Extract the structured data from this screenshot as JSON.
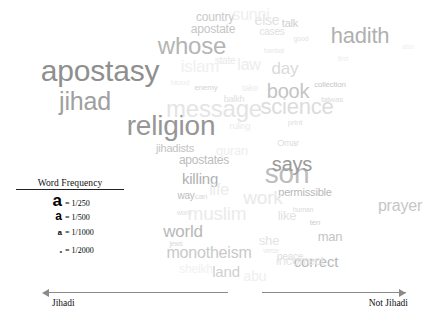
{
  "figure": {
    "type": "word-cloud",
    "background": "#ffffff"
  },
  "legend": {
    "title": "Word Frequency",
    "rows": [
      {
        "glyph": "a",
        "glyph_size_px": 17,
        "value": "= 1/250"
      },
      {
        "glyph": "a",
        "glyph_size_px": 12,
        "value": "= 1/500"
      },
      {
        "glyph": "a",
        "glyph_size_px": 7.5,
        "value": "= 1/1000"
      },
      {
        "glyph": "a",
        "glyph_size_px": 4,
        "value": "= 1/2000"
      }
    ]
  },
  "axis": {
    "left_label": "Jihadi",
    "right_label": "Not Jihadi",
    "line_color": "#8a8a8a"
  },
  "chart_data": {
    "type": "word-cloud",
    "title": "",
    "xlabel": "",
    "ylabel": "",
    "legend_position": "bottom-left",
    "axis_left": "Jihadi",
    "axis_right": "Not Jihadi",
    "frequency_scale": [
      "1/250",
      "1/500",
      "1/1000",
      "1/2000"
    ],
    "note": "Font size encodes word frequency; darkness/opacity encodes prominence. X position spans a Jihadi (left) to Not Jihadi (right) continuum.",
    "words": [
      {
        "text": "apostasy",
        "x": 100,
        "y": 71,
        "size": 30,
        "color": "#8f8f8f",
        "opacity": 1.0
      },
      {
        "text": "religion",
        "x": 171,
        "y": 126,
        "size": 28,
        "color": "#969696",
        "opacity": 1.0
      },
      {
        "text": "jihad",
        "x": 85,
        "y": 101,
        "size": 25,
        "color": "#a0a0a0",
        "opacity": 1.0
      },
      {
        "text": "whose",
        "x": 192,
        "y": 46,
        "size": 24,
        "color": "#b4b4b4",
        "opacity": 1.0
      },
      {
        "text": "hadith",
        "x": 360,
        "y": 36,
        "size": 22,
        "color": "#b0b0b0",
        "opacity": 1.0
      },
      {
        "text": "son",
        "x": 287,
        "y": 174,
        "size": 28,
        "color": "#bdbdbd",
        "opacity": 1.0
      },
      {
        "text": "says",
        "x": 292,
        "y": 164,
        "size": 20,
        "color": "#9a9a9a",
        "opacity": 1.0
      },
      {
        "text": "book",
        "x": 288,
        "y": 91,
        "size": 20,
        "color": "#c4c4c4",
        "opacity": 1.0
      },
      {
        "text": "science",
        "x": 297,
        "y": 107,
        "size": 22,
        "color": "#dcdcdc",
        "opacity": 1.0
      },
      {
        "text": "message",
        "x": 214,
        "y": 109,
        "size": 24,
        "color": "#e4e4e4",
        "opacity": 1.0
      },
      {
        "text": "monotheism",
        "x": 209,
        "y": 253,
        "size": 16,
        "color": "#c9c9c9",
        "opacity": 1.0
      },
      {
        "text": "world",
        "x": 183,
        "y": 231,
        "size": 17,
        "color": "#b8b8b8",
        "opacity": 1.0
      },
      {
        "text": "killing",
        "x": 200,
        "y": 178,
        "size": 15,
        "color": "#b0b0b0",
        "opacity": 1.0
      },
      {
        "text": "apostates",
        "x": 204,
        "y": 160,
        "size": 12,
        "color": "#bcbcbc",
        "opacity": 1.0
      },
      {
        "text": "jihadists",
        "x": 175,
        "y": 148,
        "size": 11,
        "color": "#c2c2c2",
        "opacity": 1.0
      },
      {
        "text": "prayer",
        "x": 400,
        "y": 206,
        "size": 16,
        "color": "#c6c6c6",
        "opacity": 1.0
      },
      {
        "text": "correct",
        "x": 316,
        "y": 261,
        "size": 15,
        "color": "#b9b9b9",
        "opacity": 1.0
      },
      {
        "text": "permissible",
        "x": 305,
        "y": 192,
        "size": 11,
        "color": "#b8b8b8",
        "opacity": 1.0
      },
      {
        "text": "land",
        "x": 226,
        "y": 271,
        "size": 15,
        "color": "#cfcfcf",
        "opacity": 1.0
      },
      {
        "text": "man",
        "x": 330,
        "y": 236,
        "size": 13,
        "color": "#c4c4c4",
        "opacity": 1.0
      },
      {
        "text": "day",
        "x": 285,
        "y": 68,
        "size": 17,
        "color": "#dadada",
        "opacity": 1.0
      },
      {
        "text": "apostate",
        "x": 213,
        "y": 29,
        "size": 12,
        "color": "#c6c6c6",
        "opacity": 1.0
      },
      {
        "text": "country",
        "x": 215,
        "y": 17,
        "size": 12,
        "color": "#c9c9c9",
        "opacity": 1.0
      },
      {
        "text": "talk",
        "x": 290,
        "y": 23,
        "size": 11,
        "color": "#cecece",
        "opacity": 1.0
      },
      {
        "text": "collection",
        "x": 330,
        "y": 85,
        "size": 8,
        "color": "#c8c8c8",
        "opacity": 1.0
      },
      {
        "text": "way",
        "x": 186,
        "y": 196,
        "size": 10,
        "color": "#bcbcbc",
        "opacity": 1.0
      },
      {
        "text": "enemy",
        "x": 206,
        "y": 88,
        "size": 8,
        "color": "#d4d4d4",
        "opacity": 1.0
      },
      {
        "text": "else",
        "x": 267,
        "y": 20,
        "size": 14,
        "color": "#e2e2e2",
        "opacity": 1.0
      },
      {
        "text": "cases",
        "x": 272,
        "y": 32,
        "size": 10,
        "color": "#e0e0e0",
        "opacity": 1.0
      },
      {
        "text": "fatwas",
        "x": 332,
        "y": 100,
        "size": 8,
        "color": "#dddddd",
        "opacity": 1.0
      },
      {
        "text": "Omar",
        "x": 288,
        "y": 143,
        "size": 9,
        "color": "#dcdcdc",
        "opacity": 1.0
      },
      {
        "text": "ten",
        "x": 315,
        "y": 223,
        "size": 8,
        "color": "#cfcfcf",
        "opacity": 1.0
      },
      {
        "text": "human",
        "x": 303,
        "y": 209,
        "size": 7,
        "color": "#dbdbdb",
        "opacity": 1.0
      },
      {
        "text": "like",
        "x": 287,
        "y": 215,
        "size": 13,
        "color": "#e3e3e3",
        "opacity": 1.0
      },
      {
        "text": "she",
        "x": 269,
        "y": 240,
        "size": 13,
        "color": "#e4e4e4",
        "opacity": 1.0
      },
      {
        "text": "peace",
        "x": 290,
        "y": 257,
        "size": 10,
        "color": "#e0e0e0",
        "opacity": 1.0
      },
      {
        "text": "jews",
        "x": 176,
        "y": 243,
        "size": 7,
        "color": "#d8d8d8",
        "opacity": 1.0
      },
      {
        "text": "can",
        "x": 201,
        "y": 197,
        "size": 8,
        "color": "#dadada",
        "opacity": 1.0
      },
      {
        "text": "word",
        "x": 184,
        "y": 212,
        "size": 7,
        "color": "#dedede",
        "opacity": 1.0
      },
      {
        "text": "muslim",
        "x": 217,
        "y": 213,
        "size": 19,
        "color": "#ebebeb",
        "opacity": 1.0
      },
      {
        "text": "incorrect",
        "x": 300,
        "y": 260,
        "size": 13,
        "color": "#e6e6e6",
        "opacity": 1.0
      },
      {
        "text": "work",
        "x": 263,
        "y": 197,
        "size": 19,
        "color": "#e9e9e9",
        "opacity": 1.0
      },
      {
        "text": "life",
        "x": 219,
        "y": 190,
        "size": 16,
        "color": "#ececec",
        "opacity": 1.0
      },
      {
        "text": "state",
        "x": 225,
        "y": 61,
        "size": 10,
        "color": "#e8e8e8",
        "opacity": 1.0
      },
      {
        "text": "balkh",
        "x": 234,
        "y": 99,
        "size": 9,
        "color": "#e0e0e0",
        "opacity": 1.0
      },
      {
        "text": "print",
        "x": 295,
        "y": 123,
        "size": 8,
        "color": "#e2e2e2",
        "opacity": 1.0
      },
      {
        "text": "good",
        "x": 301,
        "y": 38,
        "size": 7,
        "color": "#e4e4e4",
        "opacity": 1.0
      },
      {
        "text": "hanbal",
        "x": 274,
        "y": 50,
        "size": 7,
        "color": "#e9e9e9",
        "opacity": 1.0
      },
      {
        "text": "law",
        "x": 249,
        "y": 65,
        "size": 16,
        "color": "#ededed",
        "opacity": 1.0
      },
      {
        "text": "sunni",
        "x": 251,
        "y": 15,
        "size": 16,
        "color": "#efefef",
        "opacity": 1.0
      },
      {
        "text": "ruling",
        "x": 240,
        "y": 126,
        "size": 9,
        "color": "#ebebeb",
        "opacity": 1.0
      },
      {
        "text": "islam",
        "x": 200,
        "y": 66,
        "size": 17,
        "color": "#f0f0f0",
        "opacity": 1.0
      },
      {
        "text": "quran",
        "x": 232,
        "y": 150,
        "size": 13,
        "color": "#eeeeee",
        "opacity": 1.0
      },
      {
        "text": "verse",
        "x": 271,
        "y": 250,
        "size": 7,
        "color": "#e9e9e9",
        "opacity": 1.0
      },
      {
        "text": "abu",
        "x": 255,
        "y": 276,
        "size": 14,
        "color": "#f0f0f0",
        "opacity": 1.0
      },
      {
        "text": "sheikh",
        "x": 196,
        "y": 269,
        "size": 12,
        "color": "#f1f1f1",
        "opacity": 1.0
      },
      {
        "text": "first",
        "x": 343,
        "y": 58,
        "size": 7,
        "color": "#ededed",
        "opacity": 1.0
      },
      {
        "text": "also",
        "x": 408,
        "y": 46,
        "size": 7,
        "color": "#f0f0f0",
        "opacity": 1.0
      },
      {
        "text": "take",
        "x": 250,
        "y": 88,
        "size": 9,
        "color": "#ebebeb",
        "opacity": 1.0
      },
      {
        "text": "blood",
        "x": 180,
        "y": 83,
        "size": 8,
        "color": "#eeeeee",
        "opacity": 1.0
      }
    ]
  }
}
